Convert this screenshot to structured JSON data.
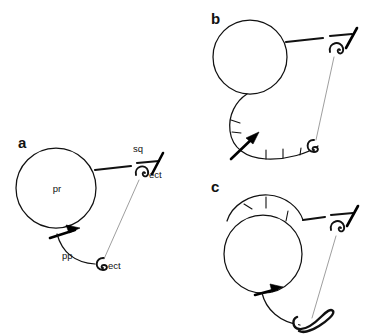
{
  "figure": {
    "background_color": "#ffffff",
    "ink_color": "#111111",
    "connector_color": "#8d8d8d",
    "width": 375,
    "height": 334
  },
  "panels": [
    {
      "id": "a",
      "letter": "a",
      "labels": [
        {
          "id": "pr",
          "text": "pr",
          "meaning": "presumptive-retina"
        },
        {
          "id": "sq",
          "text": "sq",
          "meaning": "squamous-epithelium"
        },
        {
          "id": "ect_upper",
          "text": "ect",
          "meaning": "ectoderm-upper"
        },
        {
          "id": "pp",
          "text": "pp",
          "meaning": "presumptive-pigment"
        },
        {
          "id": "ect_lower",
          "text": "ect",
          "meaning": "ectoderm-lower"
        }
      ],
      "elements": [
        "vesicle-circle",
        "upper-connector-line",
        "squamous-bar",
        "upper-hook",
        "thick-arrow",
        "lower-curve",
        "lower-hook",
        "thin-connector"
      ]
    },
    {
      "id": "b",
      "letter": "b",
      "labels": [],
      "elements": [
        "vesicle-circle",
        "upper-connector-line",
        "squamous-bar",
        "upper-hook",
        "expanded-lower-arc",
        "radial-tick-marks",
        "thick-arrow",
        "lower-hook",
        "thin-connector"
      ]
    },
    {
      "id": "c",
      "letter": "c",
      "labels": [],
      "elements": [
        "vesicle-circle",
        "upper-arc-cap",
        "radial-tick-marks",
        "upper-connector-line",
        "squamous-bar",
        "upper-hook",
        "thick-arrow",
        "lower-curve",
        "lower-hook-large",
        "thin-connector"
      ]
    }
  ]
}
